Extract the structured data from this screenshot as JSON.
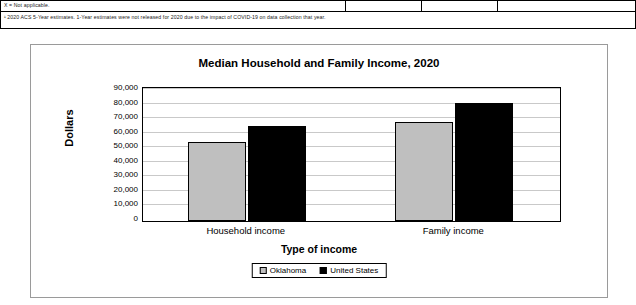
{
  "notes": {
    "line1": "X = Not applicable.",
    "line2": "¹ 2020 ACS 5-Year estimates. 1-Year estimates were not released for 2020 due to the impact of COVID-19 on data collection that year."
  },
  "legend": {
    "items": [
      {
        "label": "Oklahoma",
        "color": "#bfbfbf"
      },
      {
        "label": "United States",
        "color": "#000000"
      }
    ]
  },
  "chart_data": {
    "type": "bar",
    "title": "Median Household and Family Income, 2020",
    "xlabel": "Type of income",
    "ylabel": "Dollars",
    "categories": [
      "Household income",
      "Family income"
    ],
    "series": [
      {
        "name": "Oklahoma",
        "color": "#bfbfbf",
        "values": [
          54000,
          68000
        ]
      },
      {
        "name": "United States",
        "color": "#000000",
        "values": [
          65000,
          81000
        ]
      }
    ],
    "ylim": [
      0,
      90000
    ],
    "yticks": [
      0,
      10000,
      20000,
      30000,
      40000,
      50000,
      60000,
      70000,
      80000,
      90000
    ],
    "ytick_labels": [
      "0",
      "10,000",
      "20,000",
      "30,000",
      "40,000",
      "50,000",
      "60,000",
      "70,000",
      "80,000",
      "90,000"
    ],
    "grid": true,
    "legend_position": "bottom"
  }
}
